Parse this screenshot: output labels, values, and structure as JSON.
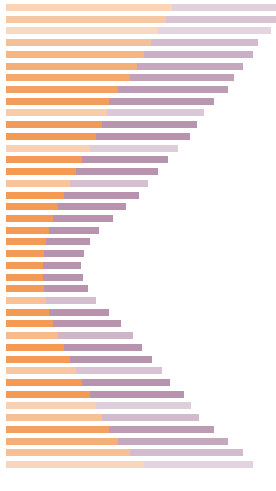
{
  "chart": {
    "title": "",
    "subtitle": "",
    "xlabel": "",
    "ylabel": "",
    "background_color": "#ffffff",
    "left_color": "#f29a56",
    "right_color": "#b793ae",
    "plot_left_px": 6,
    "plot_top_px": 4,
    "row_pitch_px": 11.72,
    "bar_height_px": 7
  },
  "chart_data": {
    "type": "bar",
    "orientation": "horizontal",
    "stacked": true,
    "title": "",
    "xlabel": "",
    "ylabel": "",
    "grid": false,
    "legend": "none",
    "xlim": [
      0,
      270
    ],
    "categories": [
      "row-01",
      "row-02",
      "row-03",
      "row-04",
      "row-05",
      "row-06",
      "row-07",
      "row-08",
      "row-09",
      "row-10",
      "row-11",
      "row-12",
      "row-13",
      "row-14",
      "row-15",
      "row-16",
      "row-17",
      "row-18",
      "row-19",
      "row-20",
      "row-21",
      "row-22",
      "row-23",
      "row-24",
      "row-25",
      "row-26",
      "row-27",
      "row-28",
      "row-29",
      "row-30",
      "row-31",
      "row-32",
      "row-33",
      "row-34",
      "row-35",
      "row-36",
      "row-37",
      "row-38",
      "row-39",
      "row-40"
    ],
    "series": [
      {
        "name": "left-segment",
        "color": "#f29a56",
        "values": [
          166,
          160,
          152,
          145,
          138,
          131,
          124,
          112,
          103,
          101,
          96,
          90,
          84,
          76,
          70,
          64,
          58,
          52,
          47,
          43,
          40,
          38,
          37,
          37,
          38,
          40,
          43,
          47,
          52,
          58,
          64,
          70,
          76,
          84,
          90,
          96,
          103,
          112,
          124,
          138
        ]
      },
      {
        "name": "right-segment",
        "color": "#b793ae",
        "values": [
          104,
          110,
          113,
          107,
          109,
          106,
          104,
          110,
          105,
          97,
          95,
          94,
          88,
          86,
          82,
          78,
          75,
          68,
          60,
          50,
          44,
          40,
          38,
          40,
          44,
          50,
          60,
          68,
          75,
          78,
          82,
          86,
          88,
          94,
          95,
          97,
          105,
          110,
          113,
          109
        ]
      }
    ],
    "row_opacity": [
      0.42,
      0.55,
      0.38,
      0.62,
      0.72,
      0.8,
      0.86,
      0.92,
      0.96,
      0.5,
      0.98,
      1.0,
      0.46,
      1.0,
      1.0,
      0.58,
      1.0,
      1.0,
      1.0,
      1.0,
      1.0,
      1.0,
      1.0,
      1.0,
      1.0,
      0.6,
      1.0,
      1.0,
      0.68,
      1.0,
      1.0,
      0.55,
      1.0,
      1.0,
      0.45,
      0.62,
      0.92,
      0.8,
      0.62,
      0.4
    ]
  }
}
